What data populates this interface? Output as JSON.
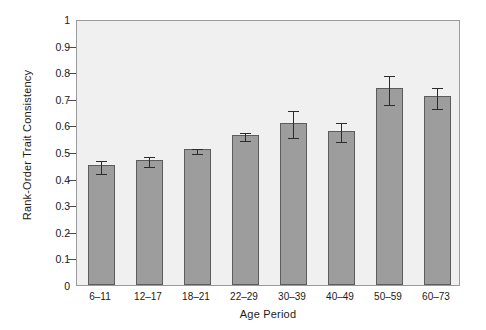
{
  "chart_data": {
    "type": "bar",
    "title": "",
    "subtitle": "",
    "xlabel": "Age Period",
    "ylabel": "Rank-Order Trait Consistency",
    "categories": [
      "6–11",
      "12–17",
      "18–21",
      "22–29",
      "30–39",
      "40–49",
      "50–59",
      "60–73"
    ],
    "values": [
      0.45,
      0.47,
      0.51,
      0.565,
      0.61,
      0.58,
      0.74,
      0.71
    ],
    "errors": [
      0.025,
      0.02,
      0.01,
      0.015,
      0.05,
      0.035,
      0.055,
      0.04
    ],
    "ylim": [
      0,
      1
    ],
    "ytick_labels": [
      "0",
      "0.1",
      "0.2",
      "0.3",
      "0.4",
      "0.5",
      "0.6",
      "0.7",
      "0.8",
      "0.9",
      "1"
    ],
    "ytick_values": [
      0,
      0.1,
      0.2,
      0.3,
      0.4,
      0.5,
      0.6,
      0.7,
      0.8,
      0.9,
      1
    ],
    "grid": false,
    "legend": "none",
    "error_bar_style": "vertical-with-caps",
    "colors": {
      "bar_fill": "#9d9d9d",
      "bar_border": "#5c5c5c",
      "plot_background": "#f0f0f0",
      "axis": "#9a9a9a",
      "error_bar": "#2b2b2b",
      "text": "#1a1a1a",
      "figure_background": "#ffffff"
    }
  }
}
